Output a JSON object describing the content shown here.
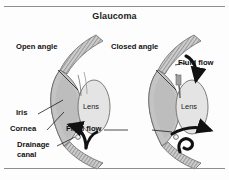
{
  "figure": {
    "title": "Glaucoma",
    "background_color": "#fdfdfd",
    "rule_color": "#8d8d8d",
    "arrow_color": "#111111",
    "sclera_color": "#c9c9c9",
    "iris_color": "#b9b9b9",
    "lens_color": "#e2e2e2",
    "outline_color": "#6a6a6a"
  },
  "left_eye": {
    "angle_label": "Open angle",
    "lens_label": "Lens",
    "iris_label": "Iris",
    "cornea_label": "Cornea",
    "drainage_label_line1": "Drainage",
    "drainage_label_line2": "canal"
  },
  "right_eye": {
    "angle_label": "Closed angle",
    "lens_label": "Lens",
    "fluid_flow_upper_label": "Fluid flow",
    "fluid_flow_lower_label": "Fluid flow"
  }
}
